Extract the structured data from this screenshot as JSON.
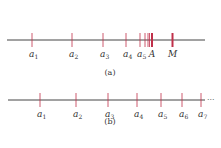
{
  "colors": {
    "axis": "#444444",
    "tick": "#c0304a",
    "text": "#333333"
  },
  "figure_a": {
    "caption": "(a)",
    "line": {
      "y": 40,
      "x1": 7,
      "x2": 205
    },
    "ticks": [
      {
        "x": 32,
        "label": "a",
        "sub": "1"
      },
      {
        "x": 72,
        "label": "a",
        "sub": "2"
      },
      {
        "x": 103,
        "label": "a",
        "sub": "3"
      },
      {
        "x": 126,
        "label": "a",
        "sub": "4"
      },
      {
        "x": 140,
        "label": "a",
        "sub": "5"
      },
      {
        "x": 145,
        "label": "",
        "sub": ""
      },
      {
        "x": 148,
        "label": "",
        "sub": ""
      },
      {
        "x": 149.5,
        "label": "",
        "sub": ""
      }
    ],
    "A": {
      "x": 152,
      "label": "A"
    },
    "M": {
      "x": 172.5,
      "label": "M"
    }
  },
  "figure_b": {
    "caption": "(b)",
    "line": {
      "y": 100,
      "x1": 8,
      "x2": 205
    },
    "ellipsis": "···",
    "ticks": [
      {
        "x": 40,
        "label": "a",
        "sub": "1"
      },
      {
        "x": 76,
        "label": "a",
        "sub": "2"
      },
      {
        "x": 108,
        "label": "a",
        "sub": "3"
      },
      {
        "x": 137,
        "label": "a",
        "sub": "4"
      },
      {
        "x": 161,
        "label": "a",
        "sub": "5"
      },
      {
        "x": 182,
        "label": "a",
        "sub": "6"
      },
      {
        "x": 201,
        "label": "a",
        "sub": "7"
      }
    ]
  }
}
